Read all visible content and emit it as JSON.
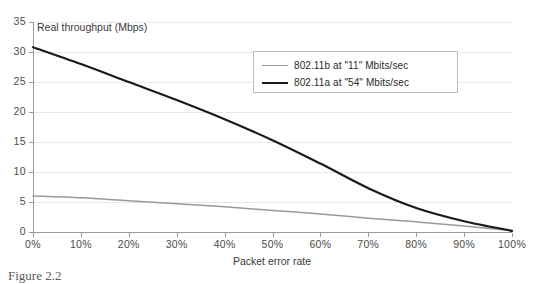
{
  "chart_data": {
    "type": "line",
    "title": "",
    "xlabel": "Packet error rate",
    "ylabel": "Real throughput (Mbps)",
    "xlim": [
      0,
      100
    ],
    "ylim": [
      0,
      35
    ],
    "grid": true,
    "legend_position": "upper-right-inside",
    "x": [
      0,
      10,
      20,
      30,
      40,
      50,
      60,
      70,
      80,
      90,
      100
    ],
    "xtick_labels": [
      "0%",
      "10%",
      "20%",
      "30%",
      "40%",
      "50%",
      "60%",
      "70%",
      "80%",
      "90%",
      "100%"
    ],
    "ytick_labels": [
      "0",
      "5",
      "10",
      "15",
      "20",
      "25",
      "30",
      "35"
    ],
    "ytick_values": [
      0,
      5,
      10,
      15,
      20,
      25,
      30,
      35
    ],
    "series": [
      {
        "name": "802.11b  at \"11\" Mbits/sec",
        "color": "#9a9a9a",
        "values": [
          6.0,
          5.7,
          5.2,
          4.7,
          4.2,
          3.6,
          3.0,
          2.3,
          1.7,
          1.0,
          0.2
        ]
      },
      {
        "name": "802.11a at \"54\" Mbits/sec",
        "color": "#1a1a1a",
        "values": [
          30.8,
          28.0,
          25.0,
          22.0,
          18.8,
          15.3,
          11.4,
          7.3,
          4.0,
          1.8,
          0.2
        ]
      }
    ]
  },
  "axes": {
    "y_title": "Real throughput (Mbps)",
    "x_title": "Packet error rate"
  },
  "legend": {
    "items": [
      {
        "label": "802.11b  at \"11\" Mbits/sec",
        "color": "#9a9a9a",
        "width": "1.6px"
      },
      {
        "label": "802.11a at \"54\" Mbits/sec",
        "color": "#1a1a1a",
        "width": "2.4px"
      }
    ]
  },
  "caption": {
    "text": "Figure 2.2"
  },
  "colors": {
    "axis": "#9a9a9a",
    "grid": "#e8e8e8",
    "text": "#4a4a4a",
    "background": "#ffffff"
  }
}
